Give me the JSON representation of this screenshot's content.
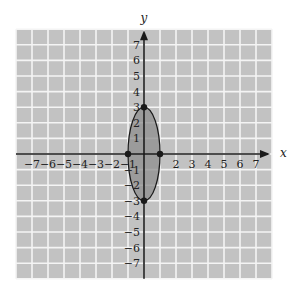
{
  "chart_data": {
    "type": "scatter",
    "title": "",
    "xlabel": "x",
    "ylabel": "y",
    "xlim": [
      -8,
      8
    ],
    "ylim": [
      -8,
      8
    ],
    "grid": true,
    "x_ticks": [
      -7,
      -6,
      -5,
      -4,
      -3,
      -2,
      -1,
      2,
      3,
      4,
      5,
      6,
      7
    ],
    "y_ticks": [
      7,
      6,
      5,
      4,
      3,
      2,
      1,
      -1,
      -2,
      -3,
      -4,
      -5,
      -6,
      -7
    ],
    "x_tick_labels": [
      "-7",
      "-6",
      "-5",
      "-4",
      "-3",
      "-2",
      "-1",
      "2",
      "3",
      "4",
      "5",
      "6",
      "7"
    ],
    "y_tick_labels": [
      "7",
      "6",
      "5",
      "4",
      "3",
      "2",
      "1",
      "-1",
      "-2",
      "-3",
      "-4",
      "-5",
      "-6",
      "-7"
    ],
    "shapes": [
      {
        "kind": "ellipse",
        "center": [
          0,
          0
        ],
        "semi_axis_x": 1,
        "semi_axis_y": 3,
        "equation": "x^2/1 + y^2/9 = 1",
        "filled": true
      }
    ],
    "points": [
      {
        "x": 0,
        "y": 3
      },
      {
        "x": 0,
        "y": -3
      },
      {
        "x": -1,
        "y": 0
      },
      {
        "x": 1,
        "y": 0
      }
    ]
  },
  "colors": {
    "grid_background": "#c2c2c2",
    "grid_lines": "#f4f4f4",
    "ellipse_fill": "#8e8e8e",
    "axis": "#1a1a1a"
  }
}
